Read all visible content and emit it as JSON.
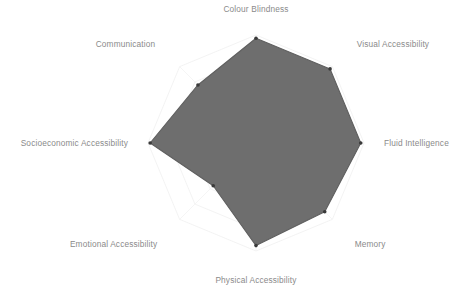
{
  "chart_data": {
    "type": "radar",
    "title": "",
    "subtitle": "",
    "xlabel": "",
    "ylabel": "",
    "grid": true,
    "grid_shape": "polygon",
    "grid_rings": 5,
    "legend": false,
    "legend_position": "none",
    "rlim": [
      0,
      1
    ],
    "categories": [
      "Colour Blindness",
      "Visual Accessibility",
      "Fluid Intelligence",
      "Memory",
      "Physical Accessibility",
      "Emotional Accessibility",
      "Socioeconomic Accessibility",
      "Communication"
    ],
    "values": [
      0.97,
      0.97,
      0.97,
      0.9,
      0.95,
      0.56,
      0.98,
      0.76
    ],
    "series": [
      {
        "name": "",
        "values": [
          0.97,
          0.97,
          0.97,
          0.9,
          0.95,
          0.56,
          0.98,
          0.76
        ]
      }
    ],
    "tick_labels": [],
    "colors": {
      "fill": "#6e6e6e",
      "fill_opacity": "1",
      "line": "#5f5f5f",
      "marker": "#3a3a3a",
      "grid": "#f0f0f0",
      "spoke": "#f2f2f2",
      "label_text": "#8a8a8a",
      "background": "#ffffff"
    }
  },
  "labels": {
    "colour_blindness": "Colour Blindness",
    "visual_accessibility": "Visual Accessibility",
    "fluid_intelligence": "Fluid Intelligence",
    "memory": "Memory",
    "physical_accessibility": "Physical Accessibility",
    "emotional_accessibility": "Emotional Accessibility",
    "socioeconomic_accessibility": "Socioeconomic Accessibility",
    "communication": "Communication"
  }
}
